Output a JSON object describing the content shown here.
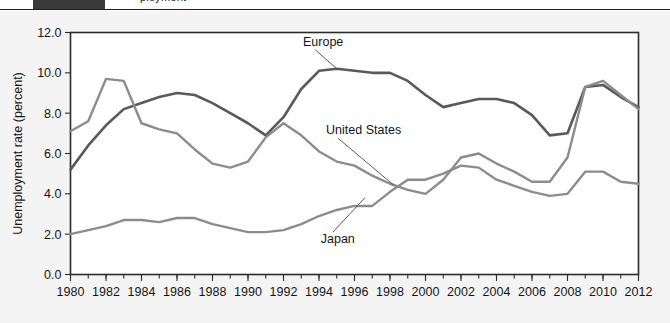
{
  "header": {
    "dark_bar_color": "#3a3a3a",
    "cropped_text": "ployment"
  },
  "figure": {
    "background": "#f4f4f4",
    "plot_background": "#ffffff",
    "frame_color": "#2b2b2b"
  },
  "chart_data": {
    "type": "line",
    "title": "",
    "xlabel": "",
    "ylabel": "Unemployment rate (percent)",
    "xlim": [
      1980,
      2012
    ],
    "ylim": [
      0.0,
      12.0
    ],
    "ytick_labels": [
      "12.0",
      "10.0",
      "8.0",
      "6.0",
      "4.0",
      "2.0",
      "0.0"
    ],
    "ytick_values": [
      12.0,
      10.0,
      8.0,
      6.0,
      4.0,
      2.0,
      0.0
    ],
    "xtick_labels": [
      "1980",
      "1982",
      "1984",
      "1986",
      "1988",
      "1990",
      "1992",
      "1994",
      "1996",
      "1998",
      "2000",
      "2002",
      "2004",
      "2006",
      "2008",
      "2010",
      "2012"
    ],
    "xtick_values": [
      1980,
      1982,
      1984,
      1986,
      1988,
      1990,
      1992,
      1994,
      1996,
      1998,
      2000,
      2002,
      2004,
      2006,
      2008,
      2010,
      2012
    ],
    "minor_xticks_every": 1,
    "grid": false,
    "legend_position": "inline-annotations",
    "x": [
      1980,
      1981,
      1982,
      1983,
      1984,
      1985,
      1986,
      1987,
      1988,
      1989,
      1990,
      1991,
      1992,
      1993,
      1994,
      1995,
      1996,
      1997,
      1998,
      1999,
      2000,
      2001,
      2002,
      2003,
      2004,
      2005,
      2006,
      2007,
      2008,
      2009,
      2010,
      2011,
      2012
    ],
    "series": [
      {
        "name": "Europe",
        "color": "#595959",
        "width": 2.6,
        "label_x": 1993.1,
        "label_y": 11.35,
        "values": [
          5.2,
          6.4,
          7.4,
          8.2,
          8.5,
          8.8,
          9.0,
          8.9,
          8.5,
          8.0,
          7.5,
          6.9,
          7.8,
          9.2,
          10.1,
          10.2,
          10.1,
          10.0,
          10.0,
          9.6,
          8.9,
          8.3,
          8.5,
          8.7,
          8.7,
          8.5,
          7.9,
          6.9,
          7.0,
          9.3,
          9.4,
          8.8,
          8.3
        ]
      },
      {
        "name": "United States",
        "color": "#8c8c8c",
        "width": 2.4,
        "label_x": 1994.4,
        "label_y": 6.95,
        "values": [
          7.1,
          7.6,
          9.7,
          9.6,
          7.5,
          7.2,
          7.0,
          6.2,
          5.5,
          5.3,
          5.6,
          6.8,
          7.5,
          6.9,
          6.1,
          5.6,
          5.4,
          4.9,
          4.5,
          4.2,
          4.0,
          4.7,
          5.8,
          6.0,
          5.5,
          5.1,
          4.6,
          4.6,
          5.8,
          9.3,
          9.6,
          8.9,
          8.2
        ]
      },
      {
        "name": "Japan",
        "color": "#8c8c8c",
        "width": 2.4,
        "label_x": 1994.1,
        "label_y": 1.55,
        "values": [
          2.0,
          2.2,
          2.4,
          2.7,
          2.7,
          2.6,
          2.8,
          2.8,
          2.5,
          2.3,
          2.1,
          2.1,
          2.2,
          2.5,
          2.9,
          3.2,
          3.4,
          3.4,
          4.1,
          4.7,
          4.7,
          5.0,
          5.4,
          5.3,
          4.7,
          4.4,
          4.1,
          3.9,
          4.0,
          5.1,
          5.1,
          4.6,
          4.5
        ]
      }
    ],
    "annotations": [
      {
        "text": "Europe",
        "points_to_series": "Europe",
        "points_to_x": 1995.0
      },
      {
        "text": "United States",
        "points_to_series": "United States",
        "points_to_x": 1998.2
      },
      {
        "text": "Japan",
        "points_to_series": "Japan",
        "points_to_x": 1996.6
      }
    ]
  }
}
